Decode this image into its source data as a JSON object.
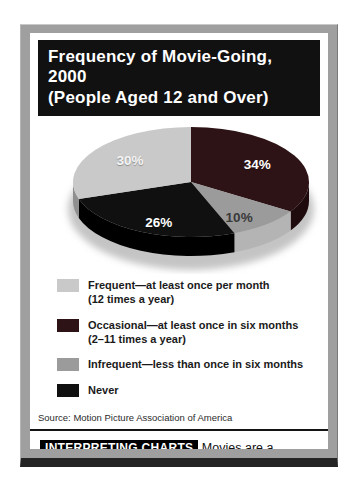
{
  "title": {
    "line1": "Frequency of Movie-Going, 2000",
    "line2": "(People Aged 12 and Over)"
  },
  "chart_data": {
    "type": "pie",
    "title": "Frequency of Movie-Going, 2000 (People Aged 12 and Over)",
    "start_angle_deg": -90,
    "direction": "clockwise",
    "legend_position": "bottom",
    "slices": [
      {
        "label": "Occasional",
        "value": 34,
        "display": "34%",
        "color": "#2e1316",
        "side_color": "#1f0b0d",
        "label_color": "#ffffff"
      },
      {
        "label": "Infrequent",
        "value": 10,
        "display": "10%",
        "color": "#9b9b9b",
        "side_color": "#b4b4b4",
        "label_color": "#3a3a3a"
      },
      {
        "label": "Never",
        "value": 26,
        "display": "26%",
        "color": "#101010",
        "side_color": "#000000",
        "label_color": "#ffffff"
      },
      {
        "label": "Frequent",
        "value": 30,
        "display": "30%",
        "color": "#c9c9c9",
        "side_color": "#8f8f8f",
        "label_color": "#f4f4f4"
      }
    ]
  },
  "legend": {
    "items": [
      {
        "color": "#c9c9c9",
        "line1": "Frequent—at least once per month",
        "line2": "(12 times a year)"
      },
      {
        "color": "#2e1316",
        "line1": "Occasional—at least once in six months",
        "line2": "(2–11 times a year)"
      },
      {
        "color": "#9b9b9b",
        "line1": "Infrequent—less than once in six months",
        "line2": ""
      },
      {
        "color": "#101010",
        "line1": "Never",
        "line2": ""
      }
    ]
  },
  "source": "Source: Motion Picture Association of America",
  "interpreting": {
    "heading": "INTERPRETING CHARTS",
    "text": "Movies are a popular form of entertainment in the United States.",
    "question": "What percentage of the population watches two or more movies a year?"
  }
}
